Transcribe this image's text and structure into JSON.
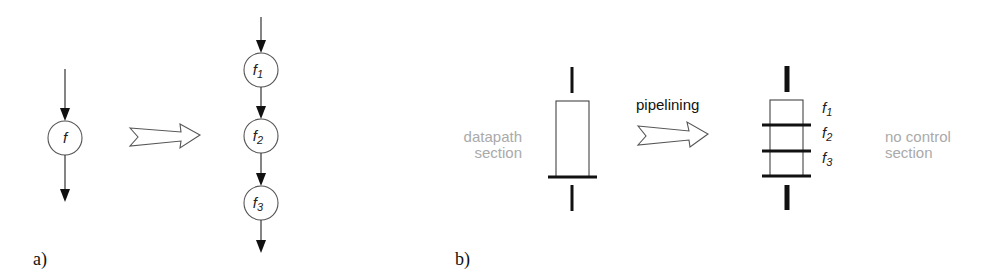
{
  "figure": {
    "panel_a": {
      "label": "a)",
      "before": {
        "node": {
          "name": "f",
          "subscript": ""
        }
      },
      "transform_arrow": "hollow-right-arrow",
      "after": {
        "nodes": [
          {
            "name": "f",
            "subscript": "1"
          },
          {
            "name": "f",
            "subscript": "2"
          },
          {
            "name": "f",
            "subscript": "3"
          }
        ]
      }
    },
    "panel_b": {
      "label": "b)",
      "left_caption_line1": "datapath",
      "left_caption_line2": "section",
      "transform_label": "pipelining",
      "transform_arrow": "hollow-right-arrow",
      "stage_labels": [
        {
          "name": "f",
          "subscript": "1"
        },
        {
          "name": "f",
          "subscript": "2"
        },
        {
          "name": "f",
          "subscript": "3"
        }
      ],
      "right_caption_line1": "no control",
      "right_caption_line2": "section"
    },
    "colors": {
      "ink": "#111111",
      "caption_gray": "#aaaaaa",
      "outline": "#555555"
    }
  }
}
